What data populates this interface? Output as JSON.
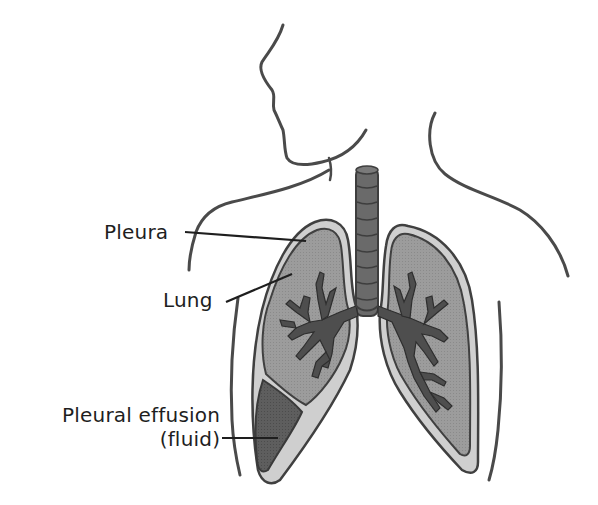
{
  "diagram": {
    "labels": {
      "pleura": "Pleura",
      "lung": "Lung",
      "effusion_line1": "Pleural effusion",
      "effusion_line2": "(fluid)"
    },
    "colors": {
      "outline": "#4a4a4a",
      "pleura_fill": "#c8c8c8",
      "lung_fill": "#9a9a9a",
      "bronchi_fill": "#4e4e4e",
      "trachea_fill": "#6a6a6a",
      "fluid_fill": "#5a5a5a",
      "label_text": "#1e1e1e",
      "leader_line": "#1e1e1e"
    }
  }
}
